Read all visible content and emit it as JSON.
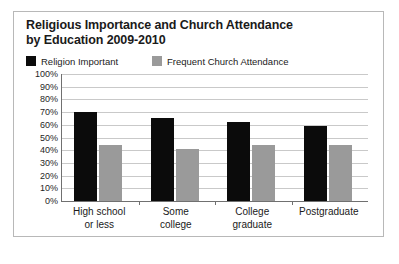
{
  "chart_data": {
    "type": "bar",
    "title": "Religious Importance and Church Attendance by Education 2009-2010",
    "title_lines": [
      "Religious Importance and Church Attendance",
      "by Education 2009-2010"
    ],
    "xlabel": "",
    "ylabel": "",
    "ylim": [
      0,
      100
    ],
    "grid": true,
    "legend_position": "top-left",
    "categories": [
      "High school or less",
      "Some college",
      "College graduate",
      "Postgraduate"
    ],
    "category_lines": [
      [
        "High school",
        "or less"
      ],
      [
        "Some",
        "college"
      ],
      [
        "College",
        "graduate"
      ],
      [
        "Postgraduate"
      ]
    ],
    "ytick_labels": [
      "100%",
      "90%",
      "80%",
      "70%",
      "60%",
      "50%",
      "40%",
      "30%",
      "20%",
      "10%",
      "0%"
    ],
    "ytick_values": [
      100,
      90,
      80,
      70,
      60,
      50,
      40,
      30,
      20,
      10,
      0
    ],
    "series": [
      {
        "name": "Religion Important",
        "color": "#0b0b0b",
        "values": [
          70,
          65,
          62,
          59
        ]
      },
      {
        "name": "Frequent Church Attendance",
        "color": "#9a9a9a",
        "values": [
          44,
          41,
          44,
          44
        ]
      }
    ]
  },
  "colors": {
    "series_1": "#0b0b0b",
    "series_2": "#9a9a9a",
    "gridline": "#c9c9c9",
    "axis": "#707070",
    "frame_border": "#b8b8b8",
    "text": "#1a1a1a",
    "background": "#ffffff"
  }
}
